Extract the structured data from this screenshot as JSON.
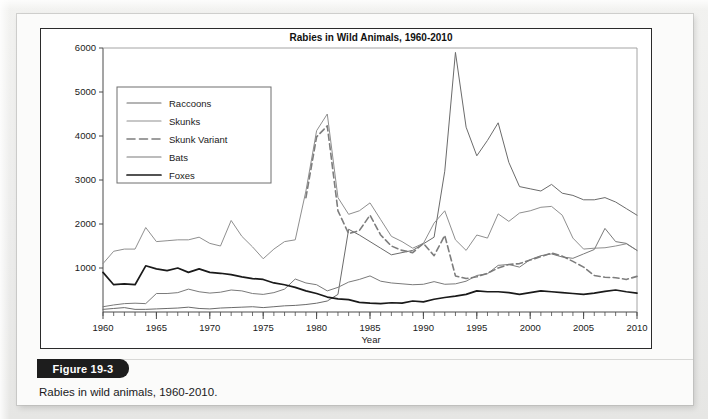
{
  "figure": {
    "badge_label": "Figure 19-3",
    "caption": "Rabies in wild animals, 1960-2010.",
    "credit": "Data from Centers for Disease Control and Prevention."
  },
  "chart_data": {
    "type": "line",
    "title": "Rabies in Wild Animals, 1960-2010",
    "xlabel": "Year",
    "ylabel": "",
    "xlim": [
      1960,
      2010
    ],
    "ylim": [
      0,
      6000
    ],
    "ytick_values": [
      1000,
      2000,
      3000,
      4000,
      5000,
      6000
    ],
    "ytick_labels": [
      "1000",
      "2000",
      "3000",
      "4000",
      "5000",
      "6000"
    ],
    "xtick_values": [
      1960,
      1965,
      1970,
      1975,
      1980,
      1985,
      1990,
      1995,
      2000,
      2005,
      2010
    ],
    "xtick_labels": [
      "1960",
      "1965",
      "1970",
      "1975",
      "1980",
      "1985",
      "1990",
      "1995",
      "2000",
      "2005",
      "2010"
    ],
    "minor_xticks_every": 1,
    "grid": false,
    "legend_position": "upper-left",
    "x": [
      1960,
      1961,
      1962,
      1963,
      1964,
      1965,
      1966,
      1967,
      1968,
      1969,
      1970,
      1971,
      1972,
      1973,
      1974,
      1975,
      1976,
      1977,
      1978,
      1979,
      1980,
      1981,
      1982,
      1983,
      1984,
      1985,
      1986,
      1987,
      1988,
      1989,
      1990,
      1991,
      1992,
      1993,
      1994,
      1995,
      1996,
      1997,
      1998,
      1999,
      2000,
      2001,
      2002,
      2003,
      2004,
      2005,
      2006,
      2007,
      2008,
      2009,
      2010
    ],
    "series": [
      {
        "name": "Raccoons",
        "style": "solid",
        "color": "#6b6b6b",
        "width": 1.0,
        "values": [
          60,
          80,
          100,
          60,
          60,
          70,
          80,
          90,
          110,
          80,
          70,
          90,
          100,
          110,
          120,
          100,
          120,
          140,
          150,
          170,
          200,
          250,
          400,
          1880,
          1750,
          1600,
          1450,
          1300,
          1350,
          1400,
          1550,
          1700,
          3200,
          5900,
          4200,
          3550,
          3900,
          4300,
          3400,
          2850,
          2800,
          2750,
          2900,
          2700,
          2650,
          2550,
          2550,
          2600,
          2500,
          2350,
          2200
        ]
      },
      {
        "name": "Skunks",
        "style": "solid",
        "color": "#8f8f8f",
        "width": 1.0,
        "values": [
          1100,
          1380,
          1430,
          1430,
          1920,
          1600,
          1620,
          1640,
          1640,
          1700,
          1560,
          1500,
          2080,
          1720,
          1480,
          1210,
          1430,
          1600,
          1640,
          2750,
          4120,
          4500,
          2600,
          2220,
          2300,
          2480,
          2100,
          1720,
          1600,
          1450,
          1560,
          2020,
          2300,
          1640,
          1400,
          1750,
          1680,
          2230,
          2060,
          2250,
          2300,
          2380,
          2400,
          2200,
          1680,
          1430,
          1450,
          1460,
          1500,
          1550,
          1400
        ]
      },
      {
        "name": "Skunk Variant",
        "style": "dashed",
        "color": "#7d7d7d",
        "width": 1.6,
        "values": [
          null,
          null,
          null,
          null,
          null,
          null,
          null,
          null,
          null,
          null,
          null,
          null,
          null,
          null,
          null,
          null,
          null,
          null,
          null,
          2600,
          3980,
          4230,
          2300,
          1780,
          1850,
          2200,
          1750,
          1500,
          1400,
          1350,
          1560,
          1280,
          1740,
          820,
          760,
          800,
          880,
          1000,
          1080,
          1100,
          1180,
          1260,
          1340,
          1270,
          1150,
          1020,
          830,
          790,
          780,
          740,
          810
        ]
      },
      {
        "name": "Bats",
        "style": "solid",
        "color": "#7a7a7a",
        "width": 1.0,
        "values": [
          120,
          160,
          190,
          200,
          190,
          420,
          420,
          440,
          520,
          460,
          430,
          450,
          500,
          480,
          420,
          400,
          440,
          520,
          750,
          660,
          620,
          480,
          560,
          680,
          740,
          820,
          700,
          660,
          640,
          620,
          630,
          690,
          630,
          640,
          700,
          830,
          870,
          1060,
          1080,
          1020,
          1190,
          1280,
          1320,
          1250,
          1220,
          1320,
          1420,
          1900,
          1600,
          1560,
          1400
        ]
      },
      {
        "name": "Foxes",
        "style": "solid",
        "color": "#1a1a1a",
        "width": 1.7,
        "values": [
          900,
          620,
          640,
          620,
          1050,
          980,
          940,
          1000,
          900,
          980,
          900,
          880,
          850,
          800,
          760,
          740,
          660,
          620,
          560,
          480,
          420,
          340,
          300,
          280,
          220,
          200,
          190,
          210,
          200,
          250,
          230,
          290,
          330,
          360,
          400,
          480,
          460,
          460,
          440,
          400,
          440,
          480,
          460,
          440,
          420,
          400,
          430,
          470,
          500,
          460,
          430
        ]
      }
    ]
  }
}
